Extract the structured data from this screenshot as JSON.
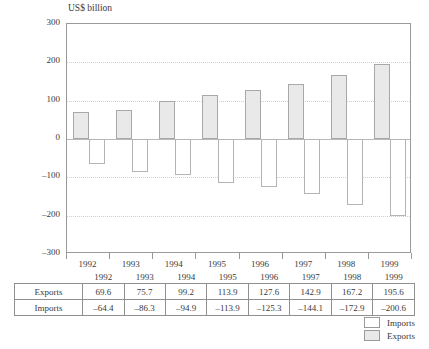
{
  "chart_data": {
    "type": "bar",
    "title": "US$ billion",
    "xlabel": "",
    "ylabel": "US$ billion",
    "ylim": [
      -300,
      300
    ],
    "yticks": [
      300,
      200,
      100,
      0,
      -100,
      -200,
      -300
    ],
    "ytick_labels": [
      "300",
      "200",
      "100",
      "0",
      "–100",
      "–200",
      "–300"
    ],
    "grid": true,
    "legend_position": "bottom-right",
    "categories": [
      "1992",
      "1993",
      "1994",
      "1995",
      "1996",
      "1997",
      "1998",
      "1999"
    ],
    "series": [
      {
        "name": "Exports",
        "color": "#e9e9e9",
        "values": [
          69.6,
          75.7,
          99.2,
          113.9,
          127.6,
          142.9,
          167.2,
          195.6
        ],
        "labels": [
          "69.6",
          "75.7",
          "99.2",
          "113.9",
          "127.6",
          "142.9",
          "167.2",
          "195.6"
        ]
      },
      {
        "name": "Imports",
        "color": "#ffffff",
        "values": [
          -64.4,
          -86.3,
          -94.9,
          -113.9,
          -125.3,
          -144.1,
          -172.9,
          -200.6
        ],
        "labels": [
          "–64.4",
          "–86.3",
          "–94.9",
          "–113.9",
          "–125.3",
          "–144.1",
          "–172.9",
          "–200.6"
        ]
      }
    ]
  },
  "table": {
    "corner": "",
    "column_headers": [
      "1992",
      "1993",
      "1994",
      "1995",
      "1996",
      "1997",
      "1998",
      "1999"
    ],
    "rows": [
      {
        "label": "Exports",
        "values": [
          "69.6",
          "75.7",
          "99.2",
          "113.9",
          "127.6",
          "142.9",
          "167.2",
          "195.6"
        ]
      },
      {
        "label": "Imports",
        "values": [
          "–64.4",
          "–86.3",
          "–94.9",
          "–113.9",
          "–125.3",
          "–144.1",
          "–172.9",
          "–200.6"
        ]
      }
    ]
  },
  "legend": {
    "items": [
      {
        "label": "Imports",
        "swatch": "white"
      },
      {
        "label": "Exports",
        "swatch": "grey"
      }
    ]
  }
}
